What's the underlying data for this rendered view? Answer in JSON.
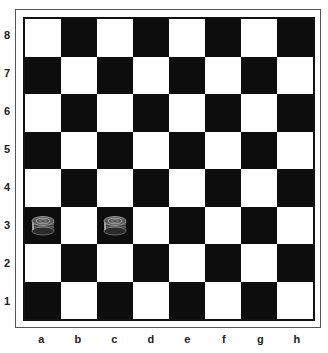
{
  "board": {
    "ranks": [
      "8",
      "7",
      "6",
      "5",
      "4",
      "3",
      "2",
      "1"
    ],
    "files": [
      "a",
      "b",
      "c",
      "d",
      "e",
      "f",
      "g",
      "h"
    ],
    "colors": {
      "light": "#ffffff",
      "dark": "#0d0d0d"
    },
    "pieces": [
      {
        "square": "a3",
        "type": "checker",
        "color": "gray"
      },
      {
        "square": "c3",
        "type": "checker",
        "color": "gray"
      }
    ]
  }
}
